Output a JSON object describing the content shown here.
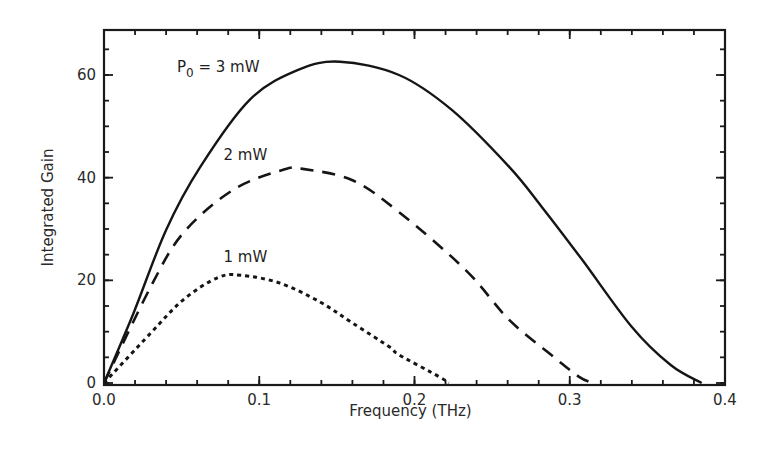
{
  "chart_data": {
    "type": "line",
    "title": "",
    "xlabel": "Frequency (THz)",
    "ylabel": "Integrated Gain",
    "xlim": [
      0.0,
      0.4
    ],
    "ylim": [
      0,
      69
    ],
    "xticks": [
      0.0,
      0.1,
      0.2,
      0.3,
      0.4
    ],
    "xtick_labels": [
      "0.0",
      "0.1",
      "0.2",
      "0.3",
      "0.4"
    ],
    "x_minor_step": 0.02,
    "yticks": [
      0,
      20,
      40,
      60
    ],
    "ytick_labels": [
      "0",
      "20",
      "40",
      "60"
    ],
    "y_minor_step": 5,
    "grid": false,
    "legend": "inline annotations",
    "series": [
      {
        "name": "P0 = 3 mW",
        "style": "solid",
        "x": [
          0.0,
          0.019,
          0.04,
          0.062,
          0.094,
          0.125,
          0.152,
          0.19,
          0.224,
          0.261,
          0.282,
          0.308,
          0.34,
          0.365,
          0.385
        ],
        "y": [
          0.0,
          13.6,
          29.8,
          42.1,
          55.2,
          61.0,
          62.6,
          60.0,
          53.2,
          42.1,
          34.3,
          24.0,
          10.9,
          3.5,
          0.0
        ]
      },
      {
        "name": "2 mW",
        "style": "dashed",
        "x": [
          0.0,
          0.03,
          0.051,
          0.083,
          0.115,
          0.128,
          0.16,
          0.19,
          0.233,
          0.261,
          0.29,
          0.306,
          0.315
        ],
        "y": [
          0.0,
          18.7,
          29.2,
          37.6,
          41.5,
          41.7,
          39.5,
          33.3,
          22.0,
          12.3,
          5.0,
          1.2,
          0.0
        ]
      },
      {
        "name": "1 mW",
        "style": "dotted",
        "x": [
          0.0,
          0.03,
          0.051,
          0.073,
          0.088,
          0.113,
          0.139,
          0.16,
          0.184,
          0.19,
          0.216,
          0.222
        ],
        "y": [
          0.0,
          9.7,
          16.2,
          20.5,
          21.0,
          19.5,
          15.8,
          11.7,
          7.0,
          5.5,
          1.2,
          0.0
        ]
      }
    ],
    "annotations": [
      {
        "text_main": "P",
        "text_sub": "0",
        "text_rest": " = 3 mW",
        "x": 0.047,
        "y": 60.5
      },
      {
        "text": "2 mW",
        "x": 0.077,
        "y": 43.5
      },
      {
        "text": "1 mW",
        "x": 0.077,
        "y": 23.5
      }
    ]
  }
}
